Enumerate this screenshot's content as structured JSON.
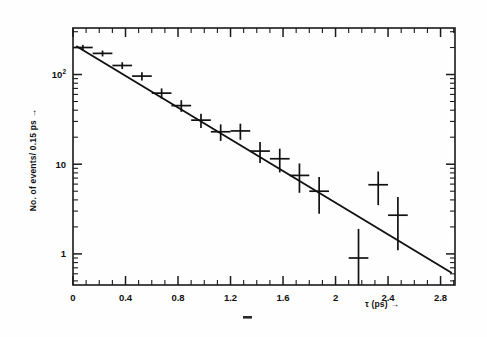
{
  "figure": {
    "name": "proper-decay-time-distribution",
    "background_color": "#fefefe",
    "ink_color": "#101010"
  },
  "axes": {
    "x_title": "τ (ps) →",
    "y_title": "No. of events/ 0.15 ps →",
    "x_tick_labels": [
      "0",
      "0.4",
      "0.8",
      "1.2",
      "1.6",
      "2",
      "2.4",
      "2.8"
    ],
    "x_tick_values": [
      0,
      0.4,
      0.8,
      1.2,
      1.6,
      2.0,
      2.4,
      2.8
    ],
    "y_tick_labels": [
      "1",
      "10",
      "10²"
    ],
    "y_tick_label_base": [
      "1",
      "10",
      "10"
    ],
    "y_tick_label_exp": [
      "",
      "",
      "2"
    ],
    "y_tick_values": [
      1,
      10,
      100
    ]
  },
  "stray_mark": {
    "label": "-",
    "x": 246,
    "y": 318
  },
  "chart_data": {
    "type": "scatter",
    "title": "",
    "subtitle": "",
    "xlabel": "τ (ps) →",
    "ylabel": "No. of events/ 0.15 ps →",
    "xlim": [
      0,
      2.91
    ],
    "ylim": [
      0.45,
      330
    ],
    "yscale": "log",
    "xscale": "linear",
    "grid": false,
    "legend": null,
    "x_major_ticks": [
      0,
      0.4,
      0.8,
      1.2,
      1.6,
      2.0,
      2.4,
      2.8
    ],
    "x_minor_tick_step": 0.1,
    "y_major_ticks": [
      1,
      10,
      100
    ],
    "marker_style": "cross-with-errorbars",
    "bin_width_ps": 0.15,
    "points": [
      {
        "x": 0.075,
        "y": 200,
        "xerr": 0.075,
        "yerr_low": 14,
        "yerr_high": 14
      },
      {
        "x": 0.225,
        "y": 172,
        "xerr": 0.075,
        "yerr_low": 13,
        "yerr_high": 13
      },
      {
        "x": 0.375,
        "y": 126,
        "xerr": 0.075,
        "yerr_low": 11,
        "yerr_high": 11
      },
      {
        "x": 0.525,
        "y": 96,
        "xerr": 0.075,
        "yerr_low": 10,
        "yerr_high": 10
      },
      {
        "x": 0.675,
        "y": 62,
        "xerr": 0.075,
        "yerr_low": 8,
        "yerr_high": 8
      },
      {
        "x": 0.825,
        "y": 45,
        "xerr": 0.075,
        "yerr_low": 6.7,
        "yerr_high": 6.7
      },
      {
        "x": 0.975,
        "y": 31,
        "xerr": 0.075,
        "yerr_low": 5.6,
        "yerr_high": 5.6
      },
      {
        "x": 1.125,
        "y": 23,
        "xerr": 0.075,
        "yerr_low": 4.8,
        "yerr_high": 4.8
      },
      {
        "x": 1.275,
        "y": 23.5,
        "xerr": 0.075,
        "yerr_low": 4.8,
        "yerr_high": 4.8
      },
      {
        "x": 1.425,
        "y": 14,
        "xerr": 0.075,
        "yerr_low": 3.7,
        "yerr_high": 3.7
      },
      {
        "x": 1.575,
        "y": 11.5,
        "xerr": 0.075,
        "yerr_low": 3.4,
        "yerr_high": 3.4
      },
      {
        "x": 1.725,
        "y": 7.5,
        "xerr": 0.075,
        "yerr_low": 2.7,
        "yerr_high": 2.7
      },
      {
        "x": 1.875,
        "y": 5.0,
        "xerr": 0.075,
        "yerr_low": 2.2,
        "yerr_high": 2.2
      },
      {
        "x": 2.175,
        "y": 0.9,
        "xerr": 0.075,
        "yerr_low": 0.45,
        "yerr_high": 1.0
      },
      {
        "x": 2.325,
        "y": 5.9,
        "xerr": 0.075,
        "yerr_low": 2.4,
        "yerr_high": 2.4
      },
      {
        "x": 2.475,
        "y": 2.7,
        "xerr": 0.075,
        "yerr_low": 1.6,
        "yerr_high": 1.6
      }
    ],
    "fit_line": {
      "name": "exponential-fit",
      "type": "exponential",
      "x_start": 0.03,
      "x_end": 2.88,
      "y_start": 205,
      "y_end": 0.62
    }
  }
}
